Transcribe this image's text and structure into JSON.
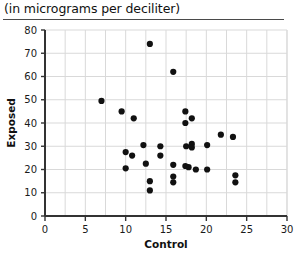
{
  "caption": "(in micrograms per deciliter)",
  "chart_data": {
    "type": "scatter",
    "title": "(in micrograms per deciliter)",
    "xlabel": "Control",
    "ylabel": "Exposed",
    "xlim": [
      0,
      30
    ],
    "ylim": [
      0,
      80
    ],
    "xticks": [
      0,
      5,
      10,
      15,
      20,
      25,
      30
    ],
    "xtick_labels": [
      "0",
      "5",
      "10",
      "15",
      "20",
      "25",
      "30"
    ],
    "yticks": [
      0,
      10,
      20,
      30,
      40,
      50,
      60,
      70,
      80
    ],
    "ytick_labels": [
      "0",
      "10",
      "20",
      "30",
      "40",
      "50",
      "60",
      "70",
      "80"
    ],
    "x_minor_tick_step": 2.5,
    "grid": true,
    "legend": null,
    "marker": "filled-circle",
    "marker_color": "#111111",
    "marker_size_px": 5,
    "points": [
      [
        7.0,
        49.5
      ],
      [
        9.5,
        45.0
      ],
      [
        11.0,
        42.0
      ],
      [
        13.0,
        74.0
      ],
      [
        15.9,
        62.0
      ],
      [
        10.0,
        27.5
      ],
      [
        10.8,
        26.0
      ],
      [
        10.0,
        20.5
      ],
      [
        12.2,
        30.5
      ],
      [
        12.5,
        22.5
      ],
      [
        13.0,
        15.0
      ],
      [
        13.0,
        11.0
      ],
      [
        14.3,
        30.0
      ],
      [
        14.3,
        26.0
      ],
      [
        15.9,
        22.0
      ],
      [
        15.9,
        17.0
      ],
      [
        15.9,
        14.5
      ],
      [
        17.4,
        45.0
      ],
      [
        17.4,
        40.0
      ],
      [
        17.5,
        30.0
      ],
      [
        18.2,
        42.0
      ],
      [
        18.2,
        31.0
      ],
      [
        18.2,
        29.5
      ],
      [
        17.4,
        21.5
      ],
      [
        17.8,
        21.0
      ],
      [
        18.7,
        20.0
      ],
      [
        20.1,
        30.5
      ],
      [
        20.1,
        20.0
      ],
      [
        21.8,
        35.0
      ],
      [
        23.3,
        34.0
      ],
      [
        23.6,
        17.5
      ],
      [
        23.6,
        14.5
      ]
    ]
  },
  "colors": {
    "grid": "#d9d9d9",
    "axis": "#333333",
    "marker": "#111111",
    "rule": "#4a4a4a"
  }
}
